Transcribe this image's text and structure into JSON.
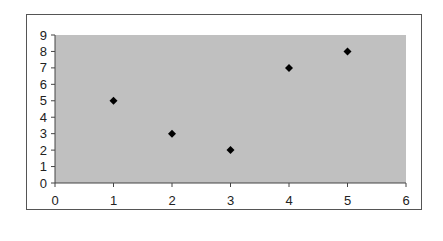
{
  "chart_data": {
    "type": "scatter",
    "title": "",
    "xlabel": "",
    "ylabel": "",
    "x": [
      1,
      2,
      3,
      4,
      5
    ],
    "y": [
      5,
      3,
      2,
      7,
      8
    ],
    "series": [
      {
        "name": "",
        "x": [
          1,
          2,
          3,
          4,
          5
        ],
        "y": [
          5,
          3,
          2,
          7,
          8
        ],
        "marker": "diamond",
        "color": "#000000"
      }
    ],
    "xlim": [
      0,
      6
    ],
    "ylim": [
      0,
      9
    ],
    "x_ticks": [
      "0",
      "1",
      "2",
      "3",
      "4",
      "5",
      "6"
    ],
    "y_ticks": [
      "0",
      "1",
      "2",
      "3",
      "4",
      "5",
      "6",
      "7",
      "8",
      "9"
    ],
    "grid": false,
    "legend": false,
    "plot_background": "#c0c0c0",
    "chart_background": "#ffffff"
  },
  "layout": {
    "plot_left": 55,
    "plot_top": 35,
    "plot_right": 406,
    "plot_bottom": 183
  }
}
